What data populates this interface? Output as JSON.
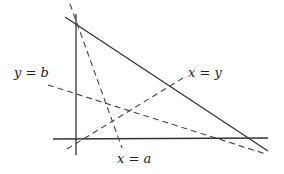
{
  "diagram": {
    "colors": {
      "background": "#ffffff",
      "solid_line": "#333333",
      "dashed_line": "#444444",
      "text": "#222222"
    },
    "axes": {
      "vertical": {
        "x1": 76,
        "y1": 14,
        "x2": 76,
        "y2": 155
      },
      "horizontal": {
        "x1": 53,
        "y1": 139,
        "x2": 268,
        "y2": 138
      }
    },
    "solid_diagonal": {
      "x1": 65,
      "y1": 17,
      "x2": 268,
      "y2": 151
    },
    "dashed_lines": [
      {
        "id": "x-equals-a",
        "x1": 70,
        "y1": 4,
        "x2": 122,
        "y2": 148,
        "label": "x = a"
      },
      {
        "id": "y-equals-b",
        "x1": 48,
        "y1": 85,
        "x2": 266,
        "y2": 154,
        "label": "y = b"
      },
      {
        "id": "x-equals-y",
        "x1": 67,
        "y1": 149,
        "x2": 183,
        "y2": 78,
        "label": "x = y"
      }
    ],
    "labels": {
      "y_equals_b": "y = b",
      "x_equals_y": "x = y",
      "x_equals_a": "x = a"
    }
  }
}
